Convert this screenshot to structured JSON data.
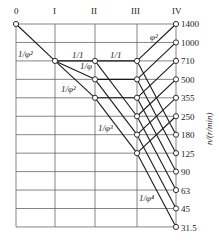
{
  "diagram": {
    "type": "speed-chart",
    "shafts": [
      "0",
      "I",
      "II",
      "III",
      "IV"
    ],
    "speeds": [
      "1400",
      "1000",
      "710",
      "500",
      "355",
      "250",
      "180",
      "125",
      "90",
      "63",
      "45",
      "31.5"
    ],
    "axis_label": "n/(r/min)",
    "ratio_labels": [
      {
        "text": "1/φ²",
        "between": "0-I"
      },
      {
        "text": "1/1",
        "between": "I-II"
      },
      {
        "text": "1/φ",
        "between": "I-II"
      },
      {
        "text": "1/φ²",
        "between": "I-II"
      },
      {
        "text": "1/1",
        "between": "II-III"
      },
      {
        "text": "1/φ³",
        "between": "II-III"
      },
      {
        "text": "φ²",
        "between": "III-IV"
      },
      {
        "text": "1/φ⁴",
        "between": "III-IV"
      }
    ]
  },
  "colors": {
    "grid": "#555555",
    "line": "#1a1a1a",
    "node_fill": "#ffffff"
  }
}
